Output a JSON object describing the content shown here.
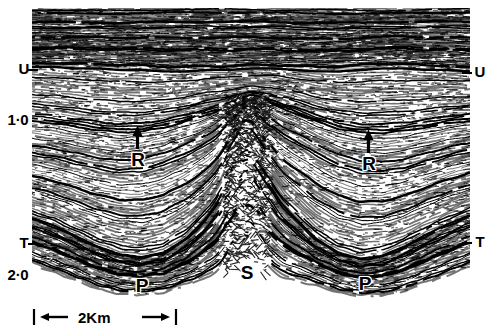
{
  "figure": {
    "kind": "seismic-reflection-section"
  },
  "axes": {
    "time_axis_unit": "s",
    "time_ticks": [
      {
        "label": "1·0",
        "value": 1.0,
        "y": 120
      },
      {
        "label": "2·0",
        "value": 2.0,
        "y": 275
      }
    ],
    "horizon_ticks_left": [
      {
        "label": "U",
        "y": 69
      },
      {
        "label": "T",
        "y": 243
      }
    ],
    "horizon_ticks_right": [
      {
        "label": "U",
        "y": 72
      },
      {
        "label": "T",
        "y": 242
      }
    ]
  },
  "annotations": {
    "horizons": [
      {
        "name": "U",
        "label": "U",
        "side": "left"
      },
      {
        "name": "U",
        "label": "U",
        "side": "right"
      },
      {
        "name": "T",
        "label": "T",
        "side": "left"
      },
      {
        "name": "T",
        "label": "T",
        "side": "right"
      }
    ],
    "markers": [
      {
        "name": "R-left",
        "label": "R",
        "x": 137,
        "y": 160,
        "arrow": true
      },
      {
        "name": "R-right",
        "label": "R",
        "x": 368,
        "y": 164,
        "arrow": true
      },
      {
        "name": "P-left",
        "label": "P",
        "x": 141,
        "y": 286,
        "arrow": false
      },
      {
        "name": "S-centre",
        "label": "S",
        "x": 246,
        "y": 273,
        "arrow": false
      },
      {
        "name": "P-right",
        "label": "P",
        "x": 364,
        "y": 284,
        "arrow": false
      }
    ]
  },
  "scale": {
    "label": "2Km",
    "length_km": 2,
    "bar_px": 145
  },
  "colors": {
    "ink": "#000000",
    "paper": "#ffffff"
  },
  "chart_data": {
    "type": "line",
    "title": "",
    "xlabel": "",
    "ylabel": "s",
    "ylim": [
      0.35,
      2.35
    ],
    "grid": false,
    "legend": "none",
    "note": "Wiggle-trace seismic section; horizons U, T and markers R, P, S annotated.",
    "horizons": [
      {
        "name": "U",
        "times": [
          0.74,
          0.74,
          0.75,
          0.75,
          0.76,
          0.76,
          0.77,
          0.77,
          0.76,
          0.76,
          0.75,
          0.75,
          0.76,
          0.77,
          0.77,
          0.76,
          0.75,
          0.75,
          0.76,
          0.76,
          0.77
        ]
      },
      {
        "name": "R",
        "times": [
          1.27,
          1.29,
          1.32,
          1.35,
          1.37,
          1.36,
          1.32,
          1.26,
          1.2,
          1.14,
          1.1,
          1.12,
          1.18,
          1.26,
          1.33,
          1.37,
          1.38,
          1.36,
          1.32,
          1.28,
          1.25
        ]
      },
      {
        "name": "T",
        "times": [
          1.74,
          1.79,
          1.86,
          1.93,
          1.98,
          2.0,
          1.97,
          1.88,
          1.74,
          1.6,
          1.54,
          1.6,
          1.74,
          1.88,
          1.97,
          2.01,
          1.99,
          1.93,
          1.85,
          1.78,
          1.72
        ]
      },
      {
        "name": "P",
        "times": [
          1.92,
          1.97,
          2.03,
          2.09,
          2.13,
          2.14,
          2.12,
          2.06,
          1.98,
          1.92,
          1.9,
          1.93,
          1.99,
          2.06,
          2.12,
          2.15,
          2.14,
          2.1,
          2.04,
          1.98,
          1.92
        ]
      }
    ]
  }
}
